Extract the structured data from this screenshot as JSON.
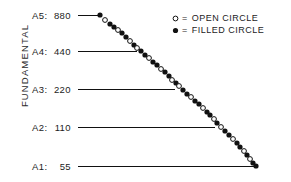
{
  "figure": {
    "width": 291,
    "height": 182,
    "background": "#ffffff",
    "ink": "#111111"
  },
  "axis": {
    "y_title": "FUNDAMENTAL"
  },
  "legend": {
    "items": [
      {
        "marker": "open-circle",
        "equals": "=",
        "label": "OPEN CIRCLE"
      },
      {
        "marker": "filled-circle",
        "equals": "=",
        "label": "FILLED CIRCLE"
      }
    ]
  },
  "octaves": [
    {
      "name": "A5",
      "sep": ":",
      "freq": "880",
      "label_x": 32,
      "label_y": 10,
      "line_x1": 78,
      "line_x2": 100,
      "line_y": 15
    },
    {
      "name": "A4",
      "sep": ":",
      "freq": "440",
      "label_x": 32,
      "label_y": 46,
      "line_x1": 78,
      "line_x2": 137,
      "line_y": 51
    },
    {
      "name": "A3",
      "sep": ":",
      "freq": "220",
      "label_x": 32,
      "label_y": 84,
      "line_x1": 78,
      "line_x2": 175,
      "line_y": 89
    },
    {
      "name": "A2",
      "sep": ":",
      "freq": "110",
      "label_x": 32,
      "label_y": 122,
      "line_x1": 78,
      "line_x2": 215,
      "line_y": 127
    },
    {
      "name": "A1",
      "sep": ":",
      "freq": "55",
      "label_x": 32,
      "label_y": 161,
      "line_x1": 78,
      "line_x2": 256,
      "line_y": 166
    }
  ],
  "chart_data": {
    "type": "scatter",
    "title": "",
    "xlabel": "",
    "ylabel": "FUNDAMENTAL",
    "grid": false,
    "legend_position": "top-right",
    "y_categories": [
      "A5: 880",
      "A4: 440",
      "A3: 220",
      "A2: 110",
      "A1: 55"
    ],
    "y_values": [
      880,
      440,
      220,
      110,
      55
    ],
    "marker_radius": 2.6,
    "points": [
      {
        "x": 100,
        "y": 15,
        "marker": "filled-circle"
      },
      {
        "x": 105,
        "y": 20,
        "marker": "open-circle"
      },
      {
        "x": 110,
        "y": 24,
        "marker": "filled-circle"
      },
      {
        "x": 114,
        "y": 27,
        "marker": "filled-circle"
      },
      {
        "x": 118,
        "y": 30,
        "marker": "open-circle"
      },
      {
        "x": 122,
        "y": 33,
        "marker": "filled-circle"
      },
      {
        "x": 126,
        "y": 37,
        "marker": "filled-circle"
      },
      {
        "x": 130,
        "y": 41,
        "marker": "open-circle"
      },
      {
        "x": 134,
        "y": 45,
        "marker": "filled-circle"
      },
      {
        "x": 137,
        "y": 48,
        "marker": "open-circle"
      },
      {
        "x": 141,
        "y": 51,
        "marker": "filled-circle"
      },
      {
        "x": 145,
        "y": 55,
        "marker": "filled-circle"
      },
      {
        "x": 149,
        "y": 58,
        "marker": "open-circle"
      },
      {
        "x": 153,
        "y": 62,
        "marker": "filled-circle"
      },
      {
        "x": 157,
        "y": 65,
        "marker": "filled-circle"
      },
      {
        "x": 161,
        "y": 69,
        "marker": "open-circle"
      },
      {
        "x": 165,
        "y": 72,
        "marker": "filled-circle"
      },
      {
        "x": 169,
        "y": 76,
        "marker": "filled-circle"
      },
      {
        "x": 172,
        "y": 80,
        "marker": "open-circle"
      },
      {
        "x": 176,
        "y": 83,
        "marker": "filled-circle"
      },
      {
        "x": 179,
        "y": 86,
        "marker": "open-circle"
      },
      {
        "x": 183,
        "y": 90,
        "marker": "filled-circle"
      },
      {
        "x": 187,
        "y": 94,
        "marker": "filled-circle"
      },
      {
        "x": 191,
        "y": 97,
        "marker": "open-circle"
      },
      {
        "x": 195,
        "y": 101,
        "marker": "filled-circle"
      },
      {
        "x": 199,
        "y": 104,
        "marker": "filled-circle"
      },
      {
        "x": 203,
        "y": 108,
        "marker": "open-circle"
      },
      {
        "x": 207,
        "y": 112,
        "marker": "filled-circle"
      },
      {
        "x": 210,
        "y": 115,
        "marker": "filled-circle"
      },
      {
        "x": 214,
        "y": 119,
        "marker": "open-circle"
      },
      {
        "x": 217,
        "y": 123,
        "marker": "filled-circle"
      },
      {
        "x": 221,
        "y": 127,
        "marker": "open-circle"
      },
      {
        "x": 225,
        "y": 131,
        "marker": "filled-circle"
      },
      {
        "x": 229,
        "y": 135,
        "marker": "filled-circle"
      },
      {
        "x": 233,
        "y": 139,
        "marker": "open-circle"
      },
      {
        "x": 237,
        "y": 143,
        "marker": "filled-circle"
      },
      {
        "x": 240,
        "y": 147,
        "marker": "filled-circle"
      },
      {
        "x": 244,
        "y": 151,
        "marker": "open-circle"
      },
      {
        "x": 247,
        "y": 155,
        "marker": "filled-circle"
      },
      {
        "x": 250,
        "y": 159,
        "marker": "open-circle"
      },
      {
        "x": 253,
        "y": 163,
        "marker": "filled-circle"
      },
      {
        "x": 256,
        "y": 166,
        "marker": "filled-circle"
      }
    ]
  }
}
